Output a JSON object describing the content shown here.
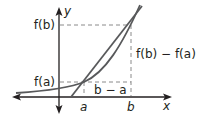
{
  "diagram": {
    "axes": {
      "x_label": "x",
      "y_label": "y"
    },
    "points": {
      "a": "a",
      "b": "b"
    },
    "y_values": {
      "fa": "f(a)",
      "fb": "f(b)"
    },
    "differences": {
      "run": "b − a",
      "rise": "f(b) − f(a)"
    },
    "colors": {
      "curve": "#58595b",
      "axes": "#231f20",
      "dashed": "#808080",
      "text": "#231f20"
    }
  }
}
